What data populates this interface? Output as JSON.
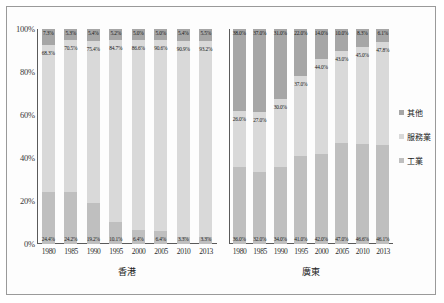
{
  "chart_data": {
    "type": "bar",
    "subtype": "stacked-percentage",
    "title": "",
    "xlabel": "",
    "ylabel": "",
    "ylim": [
      0,
      100
    ],
    "ytick_labels": [
      "0%",
      "20%",
      "40%",
      "60%",
      "80%",
      "100%"
    ],
    "ytick_values": [
      0,
      20,
      40,
      60,
      80,
      100
    ],
    "grid": false,
    "legend_position": "right",
    "legend": [
      "其他",
      "服務業",
      "工業"
    ],
    "colors": {
      "other": "#a6a6a6",
      "service": "#d9d9d9",
      "industry": "#bfbfbf"
    },
    "panels": [
      {
        "name": "香港",
        "categories": [
          "1980",
          "1985",
          "1990",
          "1995",
          "2000",
          "2005",
          "2010",
          "2013"
        ],
        "series": [
          {
            "name": "其他",
            "values": [
              7.3,
              5.3,
              5.4,
              5.2,
              5.0,
              5.0,
              5.4,
              5.5
            ],
            "labels": [
              "7.3%",
              "5.3%",
              "5.4%",
              "5.2%",
              "5.0%",
              "5.0%",
              "5.4%",
              "5.5%"
            ]
          },
          {
            "name": "服務業",
            "values": [
              68.3,
              70.5,
              75.4,
              84.7,
              86.6,
              90.6,
              90.9,
              93.2
            ],
            "labels": [
              "68.3%",
              "70.5%",
              "75.4%",
              "84.7%",
              "86.6%",
              "90.6%",
              "90.9%",
              "93.2%"
            ]
          },
          {
            "name": "工業",
            "values": [
              24.4,
              24.2,
              19.2,
              10.1,
              6.4,
              6.4,
              3.3,
              3.3
            ],
            "labels": [
              "24.4%",
              "24.2%",
              "19.2%",
              "10.1%",
              "6.4%",
              "6.4%",
              "3.3%",
              "3.3%"
            ]
          }
        ]
      },
      {
        "name": "廣東",
        "categories": [
          "1980",
          "1985",
          "1990",
          "1995",
          "2000",
          "2005",
          "2010",
          "2013"
        ],
        "series": [
          {
            "name": "其他",
            "values": [
              38.0,
              37.0,
              31.0,
              22.0,
              14.0,
              10.0,
              8.3,
              6.1
            ],
            "labels": [
              "38.0%",
              "37.0%",
              "31.0%",
              "22.0%",
              "14.0%",
              "10.0%",
              "8.3%",
              "6.1%"
            ]
          },
          {
            "name": "服務業",
            "values": [
              26.0,
              27.0,
              30.0,
              37.0,
              44.0,
              43.0,
              45.0,
              47.8
            ],
            "labels": [
              "26.0%",
              "27.0%",
              "30.0%",
              "37.0%",
              "44.0%",
              "43.0%",
              "45.0%",
              "47.8%"
            ]
          },
          {
            "name": "工業",
            "values": [
              36.0,
              32.0,
              34.0,
              41.0,
              42.0,
              47.0,
              46.6,
              46.1
            ],
            "labels": [
              "36.0%",
              "32.0%",
              "34.0%",
              "41.0%",
              "42.0%",
              "47.0%",
              "46.6%",
              "46.1%"
            ]
          }
        ]
      }
    ]
  },
  "legend": {
    "items": [
      {
        "label": "其他",
        "color": "#a6a6a6"
      },
      {
        "label": "服務業",
        "color": "#d9d9d9"
      },
      {
        "label": "工業",
        "color": "#bfbfbf"
      }
    ]
  }
}
